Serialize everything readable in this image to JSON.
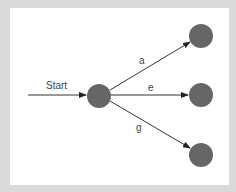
{
  "diagram": {
    "type": "state-transition",
    "start_label": "Start",
    "colors": {
      "background": "#dadada",
      "panel": "#ffffff",
      "node_fill": "#666666",
      "edge": "#333333",
      "text": "#444444"
    },
    "nodes": [
      {
        "id": "start",
        "cx": 99,
        "cy": 96,
        "r": 12
      },
      {
        "id": "top",
        "cx": 201,
        "cy": 36,
        "r": 12
      },
      {
        "id": "middle",
        "cx": 201,
        "cy": 95,
        "r": 12
      },
      {
        "id": "bottom",
        "cx": 201,
        "cy": 155,
        "r": 12
      }
    ],
    "edges": [
      {
        "from": "start",
        "to": "top",
        "label": "a"
      },
      {
        "from": "start",
        "to": "middle",
        "label": "e"
      },
      {
        "from": "start",
        "to": "bottom",
        "label": "g"
      }
    ]
  }
}
